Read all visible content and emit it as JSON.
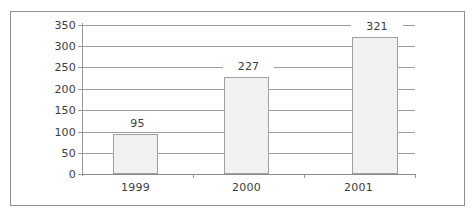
{
  "chart_data": {
    "type": "bar",
    "title": "",
    "subtitle": "",
    "xlabel": "",
    "ylabel": "",
    "categories": [
      "1999",
      "2000",
      "2001"
    ],
    "values": [
      95,
      227,
      321
    ],
    "value_labels": [
      "95",
      "227",
      "321"
    ],
    "series": [
      {
        "name": "",
        "values": [
          95,
          227,
          321
        ]
      }
    ],
    "ylim": [
      0,
      350
    ],
    "y_ticks": [
      0,
      50,
      100,
      150,
      200,
      250,
      300,
      350
    ],
    "y_tick_labels": [
      "0",
      "50",
      "100",
      "150",
      "200",
      "250",
      "300",
      "350"
    ],
    "grid": true,
    "grid_axis": "y",
    "legend": false,
    "legend_position": "none",
    "data_labels_shown": true,
    "colors": {
      "bar_fill": "#f1f1f1",
      "bar_border": "#a0a0a0",
      "gridline": "#9d9d9d",
      "axis": "#9a9a9a",
      "text": "#3c3c3c",
      "frame": "#8f8f8f",
      "background": "#ffffff"
    }
  }
}
